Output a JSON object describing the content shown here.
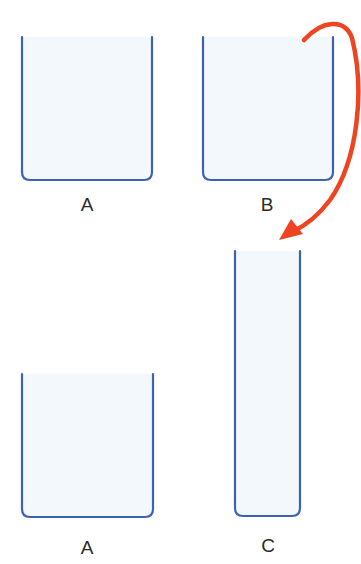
{
  "diagram": {
    "colors": {
      "beaker_stroke": "#3f62b0",
      "beaker_fill": "#f3f8fd",
      "arrow": "#ee4422",
      "label": "#2a2a2a"
    },
    "containers": [
      {
        "id": "top-a",
        "label": "A",
        "shape": "wide-beaker",
        "contents": "empty/liquid (light)"
      },
      {
        "id": "top-b",
        "label": "B",
        "shape": "wide-beaker",
        "contents": "empty/liquid (light)"
      },
      {
        "id": "bottom-a",
        "label": "A",
        "shape": "wide-beaker",
        "contents": "empty/liquid (light)"
      },
      {
        "id": "bottom-c",
        "label": "C",
        "shape": "tall-narrow-cylinder",
        "contents": "empty/liquid (light)"
      }
    ],
    "arrow": {
      "from": "B",
      "to": "C",
      "meaning": "pour contents of B into C"
    }
  }
}
